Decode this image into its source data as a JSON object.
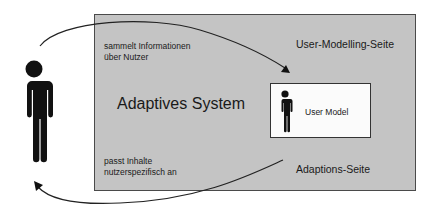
{
  "diagram": {
    "system_box": {
      "title": "Adaptives System",
      "fill": "#c4c4c4"
    },
    "user_modelling_side": {
      "label": "User-Modelling-Seite"
    },
    "adaptation_side": {
      "label": "Adaptions-Seite"
    },
    "user_model": {
      "label": "User Model"
    },
    "arrows": {
      "collect": {
        "line1": "sammelt Informationen",
        "line2": "über Nutzer"
      },
      "adapt": {
        "line1": "passt Inhalte",
        "line2": "nutzerspezifisch an"
      }
    },
    "icons": {
      "user": "person-icon",
      "user_model": "person-icon"
    }
  }
}
